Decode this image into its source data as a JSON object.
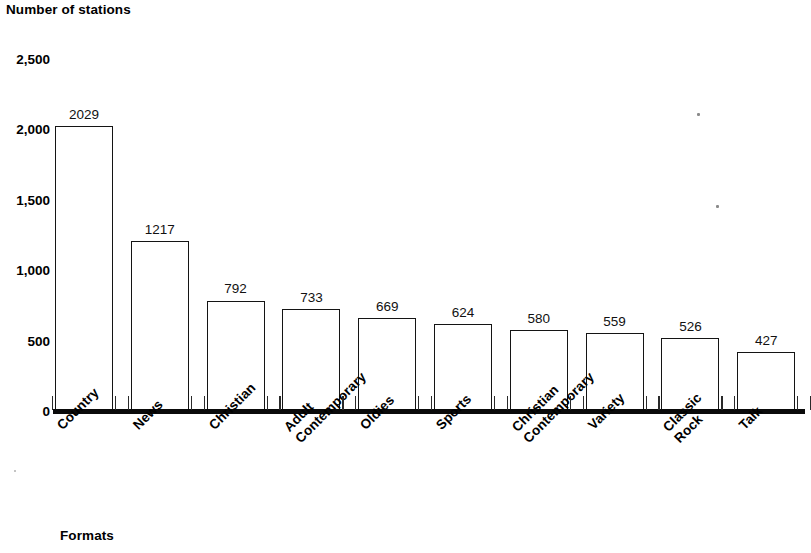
{
  "chart_data": {
    "type": "bar",
    "title": "",
    "ylabel": "Number of stations",
    "xlabel": "Formats",
    "categories": [
      "Country",
      "News",
      "Christian",
      "Adult Contemporary",
      "Oldies",
      "Sports",
      "Christian Contemporary",
      "Variety",
      "Classic Rock",
      "Talk"
    ],
    "category_lines": [
      [
        "Country"
      ],
      [
        "News"
      ],
      [
        "Christian"
      ],
      [
        "Adult",
        "Contemporary"
      ],
      [
        "Oldies"
      ],
      [
        "Sports"
      ],
      [
        "Christian",
        "Contemporary"
      ],
      [
        "Variety"
      ],
      [
        "Classic",
        "Rock"
      ],
      [
        "Talk"
      ]
    ],
    "values": [
      2029,
      1217,
      792,
      733,
      669,
      624,
      580,
      559,
      526,
      427
    ],
    "value_labels": [
      "2029",
      "1217",
      "792",
      "733",
      "669",
      "624",
      "580",
      "559",
      "526",
      "427"
    ],
    "ylim": [
      0,
      2500
    ],
    "yticks": [
      0,
      500,
      1000,
      1500,
      2000,
      2500
    ],
    "ytick_labels": [
      "0",
      "500",
      "1,000",
      "1,500",
      "2,000",
      "2,500"
    ],
    "grid": false,
    "legend": null,
    "bar_fill_color": "#ffffff",
    "bar_border_color": "#141414",
    "axis_color": "#0a0a0a"
  },
  "axis": {
    "y_title": "Number of stations",
    "x_title": "Formats"
  }
}
